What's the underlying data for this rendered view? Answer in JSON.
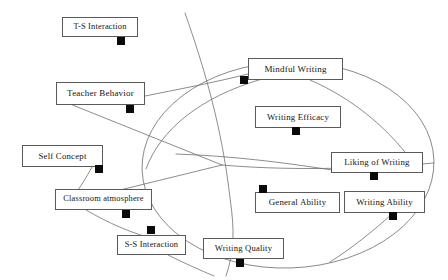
{
  "figure": {
    "type": "path-diagram"
  },
  "style": {
    "box_border_color": "#5a5a5a",
    "curve_color": "#6e6e6e",
    "marker_color": "#0a0a0a",
    "background_color": "#ffffff",
    "text_color": "#141414"
  },
  "nodes": [
    {
      "id": "ts-interaction",
      "label": "T-S Interaction",
      "x": 62,
      "y": 17,
      "w": 76,
      "h": 20,
      "font": 8.4,
      "marker": {
        "x": 117,
        "y": 37,
        "size": 8
      }
    },
    {
      "id": "teacher-behavior",
      "label": "Teacher Behavior",
      "x": 56,
      "y": 82,
      "w": 89,
      "h": 23,
      "font": 9.0,
      "marker": {
        "x": 126,
        "y": 105,
        "size": 8
      }
    },
    {
      "id": "self-concept",
      "label": "Self Concept",
      "x": 22,
      "y": 145,
      "w": 81,
      "h": 22,
      "font": 8.8,
      "marker": {
        "x": 95,
        "y": 165,
        "size": 8
      }
    },
    {
      "id": "classroom-atmosphere",
      "label": "Classroom atmosphere",
      "x": 55,
      "y": 189,
      "w": 97,
      "h": 21,
      "font": 8.4,
      "marker": {
        "x": 122,
        "y": 210,
        "size": 8
      }
    },
    {
      "id": "ss-interaction",
      "label": "S-S Interaction",
      "x": 117,
      "y": 235,
      "w": 69,
      "h": 20,
      "font": 8.4,
      "marker": {
        "x": 147,
        "y": 226,
        "size": 8
      }
    },
    {
      "id": "writing-quality",
      "label": "Writing Quality",
      "x": 203,
      "y": 238,
      "w": 81,
      "h": 21,
      "font": 8.6,
      "marker": {
        "x": 236,
        "y": 259,
        "size": 8
      }
    },
    {
      "id": "mindful-writing",
      "label": "Mindful Writing",
      "x": 248,
      "y": 58,
      "w": 95,
      "h": 22,
      "font": 9.0,
      "marker": {
        "x": 240,
        "y": 76,
        "size": 8
      }
    },
    {
      "id": "writing-efficacy",
      "label": "Writing Efficacy",
      "x": 255,
      "y": 106,
      "w": 86,
      "h": 22,
      "font": 8.8,
      "marker": {
        "x": 292,
        "y": 127,
        "size": 8
      }
    },
    {
      "id": "liking-of-writing",
      "label": "Liking of Writing",
      "x": 331,
      "y": 152,
      "w": 92,
      "h": 21,
      "font": 8.8,
      "marker": {
        "x": 370,
        "y": 172,
        "size": 8
      }
    },
    {
      "id": "general-ability",
      "label": "General Ability",
      "x": 255,
      "y": 192,
      "w": 85,
      "h": 21,
      "font": 8.8,
      "marker": {
        "x": 259,
        "y": 185,
        "size": 8
      }
    },
    {
      "id": "writing-ability",
      "label": "Writing Ability",
      "x": 344,
      "y": 191,
      "w": 81,
      "h": 22,
      "font": 8.8,
      "marker": {
        "x": 389,
        "y": 212,
        "size": 8
      }
    }
  ],
  "curves": {
    "ellipse": {
      "cx": 288,
      "cy": 165,
      "rx": 146,
      "ry": 103,
      "rotation": -2
    },
    "paths": [
      {
        "id": "partition-upper-left",
        "d": "M 146 169 C 160 130, 200 97, 262 79"
      },
      {
        "id": "partition-vertical",
        "d": "M 185 13 C 205 70, 222 128, 230 198 C 235 232, 234 252, 226 276"
      },
      {
        "id": "partition-right",
        "d": "M 222 165 C 280 170, 350 170, 434 163"
      },
      {
        "id": "spoke-teacher-upper",
        "d": "M 145 96 C 175 90, 212 83, 248 74"
      },
      {
        "id": "spoke-teacher-center",
        "d": "M 70 104 L 222 165"
      },
      {
        "id": "spoke-center-self",
        "d": "M 222 165 L 112 192"
      },
      {
        "id": "spoke-self-classroom",
        "d": "M 92 167 C 86 178, 82 184, 78 190"
      },
      {
        "id": "spoke-classroom-ss",
        "d": "M 86 210 C 110 224, 130 232, 150 238"
      },
      {
        "id": "spoke-ss-bottom",
        "d": "M 168 255 C 186 264, 200 270, 214 276"
      },
      {
        "id": "spoke-mindful-right",
        "d": "M 310 80 C 352 98, 392 130, 418 170"
      },
      {
        "id": "spoke-liking-left",
        "d": "M 332 170 C 280 162, 232 156, 176 154"
      },
      {
        "id": "spoke-writing-ability-down",
        "d": "M 392 214 C 372 232, 352 248, 330 262"
      }
    ]
  }
}
